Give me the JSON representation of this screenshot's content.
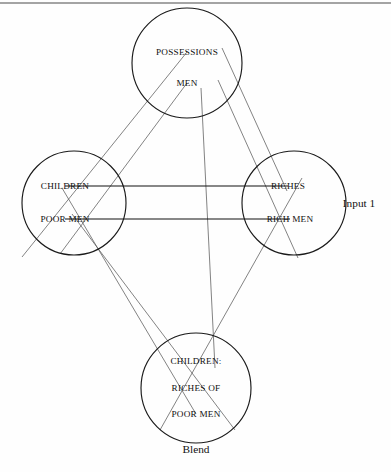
{
  "figure": {
    "type": "conceptual-blending-network",
    "background_color": "#fefefe",
    "stroke_color": "#1a1a1a",
    "projection_color": "#5a5a5a"
  },
  "spaces": {
    "top": {
      "name": "generic-space",
      "center_x": 187,
      "center_y": 63,
      "radius": 55,
      "elements": [
        {
          "label": "POSSESSIONS",
          "x": 187,
          "y": 52
        },
        {
          "label": "MEN",
          "x": 187,
          "y": 83
        }
      ]
    },
    "left": {
      "name": "input-space-left",
      "center_x": 74,
      "center_y": 203,
      "radius": 52,
      "elements": [
        {
          "label": "CHILDREN",
          "x": 65,
          "y": 186
        },
        {
          "label": "POOR MEN",
          "x": 65,
          "y": 219
        }
      ]
    },
    "right": {
      "name": "input-space-right",
      "center_x": 294,
      "center_y": 203,
      "radius": 52,
      "elements": [
        {
          "label": "RICHES",
          "x": 288,
          "y": 186
        },
        {
          "label": "RICH MEN",
          "x": 290,
          "y": 219
        }
      ]
    },
    "bottom": {
      "name": "blended-space",
      "center_x": 196,
      "center_y": 388,
      "radius": 55,
      "elements": [
        {
          "label": "CHILDREN:",
          "x": 196,
          "y": 361
        },
        {
          "label": "RICHES OF",
          "x": 196,
          "y": 388
        },
        {
          "label": "POOR MEN",
          "x": 196,
          "y": 414
        }
      ]
    }
  },
  "annotations": [
    {
      "name": "input-1-label",
      "text": "Input 1",
      "x": 359,
      "y": 203
    },
    {
      "name": "blend-label",
      "text": "Blend",
      "x": 196,
      "y": 449
    }
  ],
  "frame": {
    "top_rule": {
      "x1": 0,
      "y1": 3,
      "x2": 391,
      "y2": 3
    }
  },
  "counterpart_links": [
    {
      "name": "children-riches-link",
      "x1": 65,
      "y1": 186,
      "x2": 288,
      "y2": 186
    },
    {
      "name": "poor-men-rich-men-link",
      "x1": 65,
      "y1": 219,
      "x2": 290,
      "y2": 219
    }
  ],
  "projection_links": [
    {
      "name": "possessions-to-children",
      "x1": 187,
      "y1": 52,
      "x2": 22,
      "y2": 257
    },
    {
      "name": "men-to-poor-men",
      "x1": 187,
      "y1": 83,
      "x2": 60,
      "y2": 254
    },
    {
      "name": "possessions-to-riches",
      "x1": 222,
      "y1": 48,
      "x2": 287,
      "y2": 191
    },
    {
      "name": "men-to-rich-men",
      "x1": 218,
      "y1": 80,
      "x2": 298,
      "y2": 258
    },
    {
      "name": "children-to-blend",
      "x1": 62,
      "y1": 188,
      "x2": 196,
      "y2": 414
    },
    {
      "name": "poor-men-to-blend",
      "x1": 72,
      "y1": 214,
      "x2": 235,
      "y2": 430
    },
    {
      "name": "riches-to-blend",
      "x1": 302,
      "y1": 178,
      "x2": 160,
      "y2": 430
    },
    {
      "name": "men-to-blend-center",
      "x1": 201,
      "y1": 88,
      "x2": 215,
      "y2": 368
    }
  ]
}
